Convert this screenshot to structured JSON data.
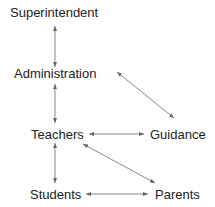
{
  "diagram": {
    "nodes": {
      "superintendent": "Superintendent",
      "administration": "Administration",
      "teachers": "Teachers",
      "guidance": "Guidance",
      "students": "Students",
      "parents": "Parents"
    },
    "edges": [
      {
        "from": "Superintendent",
        "to": "Administration",
        "type": "bidirectional"
      },
      {
        "from": "Administration",
        "to": "Teachers",
        "type": "bidirectional"
      },
      {
        "from": "Administration",
        "to": "Guidance",
        "type": "bidirectional"
      },
      {
        "from": "Teachers",
        "to": "Guidance",
        "type": "bidirectional"
      },
      {
        "from": "Teachers",
        "to": "Students",
        "type": "bidirectional"
      },
      {
        "from": "Teachers",
        "to": "Parents",
        "type": "bidirectional"
      },
      {
        "from": "Students",
        "to": "Parents",
        "type": "bidirectional"
      }
    ],
    "colors": {
      "text": "#222222",
      "arrow": "#777777"
    }
  }
}
